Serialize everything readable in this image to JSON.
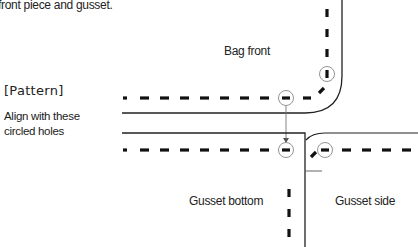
{
  "caption": "front piece and gusset.",
  "pattern_heading": "[Pattern]",
  "align_note": {
    "line1": "Align with these",
    "line2": "circled holes"
  },
  "labels": {
    "bag_front": "Bag front",
    "gusset_bottom": "Gusset bottom",
    "gusset_side": "Gusset side"
  },
  "colors": {
    "ink": "#111111",
    "outline": "#222222",
    "guide": "#777777"
  }
}
